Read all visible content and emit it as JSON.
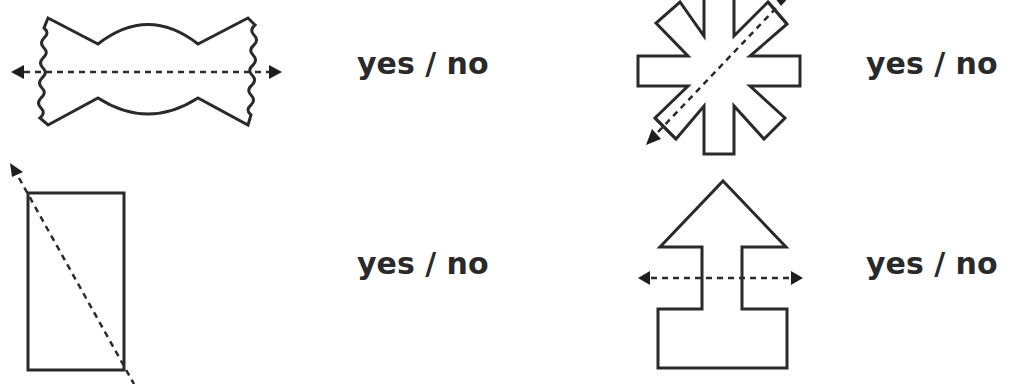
{
  "worksheet": {
    "type": "symmetry lines",
    "items": [
      {
        "shape": "wrapped-candy",
        "line": "horizontal",
        "answer_label": "yes / no"
      },
      {
        "shape": "snowflake-asterisk",
        "line": "diagonal",
        "answer_label": "yes / no"
      },
      {
        "shape": "rectangle",
        "line": "diagonal",
        "answer_label": "yes / no"
      },
      {
        "shape": "arrow-house",
        "line": "horizontal",
        "answer_label": "yes / no"
      }
    ]
  },
  "colors": {
    "ink": "#2a2a2a",
    "background": "#ffffff"
  }
}
